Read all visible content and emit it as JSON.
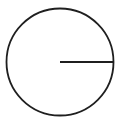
{
  "figure": {
    "kind": "geometry-diagram",
    "canvas": {
      "width": 125,
      "height": 123,
      "background_color": "#ffffff"
    },
    "circle": {
      "name": "circle",
      "center_x": 60,
      "center_y": 62,
      "radius": 53.5,
      "stroke_color": "#1f1f1f",
      "stroke_width": 1.8,
      "fill": "none"
    },
    "radius_line": {
      "name": "radius-segment",
      "x1": 60,
      "y1": 62,
      "x2": 113.5,
      "y2": 62,
      "angle_degrees": 0,
      "length": 53.5,
      "stroke_color": "#1f1f1f",
      "stroke_width": 2.2
    },
    "labels": [],
    "annotations": {
      "has_center_dot": false,
      "has_arrowheads": false,
      "has_text_labels": false
    }
  }
}
